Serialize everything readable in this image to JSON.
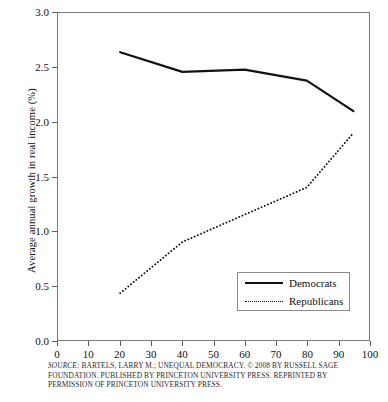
{
  "chart_data": {
    "type": "line",
    "title": "",
    "xlabel": "",
    "ylabel": "Average annual growth in real income (%)",
    "xlim": [
      0,
      100
    ],
    "ylim": [
      0.0,
      3.0
    ],
    "xticks": [
      0,
      10,
      20,
      30,
      40,
      50,
      60,
      70,
      80,
      90,
      100
    ],
    "xtick_labels": [
      "0",
      "10",
      "20",
      "30",
      "40",
      "50",
      "60",
      "70",
      "80",
      "90",
      "100"
    ],
    "yticks": [
      0.0,
      0.5,
      1.0,
      1.5,
      2.0,
      2.5,
      3.0
    ],
    "ytick_labels": [
      "0.0",
      "0.5",
      "1.0",
      "1.5",
      "2.0",
      "2.5",
      "3.0"
    ],
    "grid": false,
    "legend_position": "lower right",
    "series": [
      {
        "name": "Democrats",
        "style": "solid",
        "color": "#121212",
        "x": [
          20,
          40,
          60,
          80,
          95
        ],
        "values": [
          2.64,
          2.46,
          2.48,
          2.38,
          2.1
        ]
      },
      {
        "name": "Republicans",
        "style": "dotted",
        "color": "#121212",
        "x": [
          20,
          40,
          60,
          80,
          95
        ],
        "values": [
          0.43,
          0.9,
          1.15,
          1.4,
          1.9
        ]
      }
    ]
  },
  "legend": {
    "items": [
      {
        "label": "Democrats",
        "style": "solid"
      },
      {
        "label": "Republicans",
        "style": "dotted"
      }
    ]
  },
  "source": {
    "keyword": "SOURCE:",
    "line1": " BARTELS, LARRY M.; UNEQUAL DEMOCRACY. © 2008 BY RUSSELL SAGE",
    "line2": "FOUNDATION. PUBLISHED BY PRINCETON UNIVERSITY PRESS. REPRINTED BY",
    "line3": "PERMISSION OF PRINCETON UNIVERSITY PRESS."
  }
}
